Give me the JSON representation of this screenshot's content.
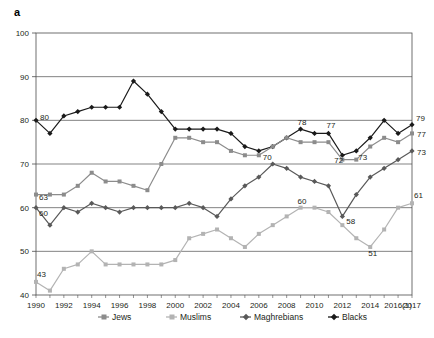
{
  "panel": {
    "label": "a"
  },
  "legend": {
    "position": "bottom",
    "items": [
      {
        "name": "Jews",
        "color": "#8c8c8c",
        "marker": "square"
      },
      {
        "name": "Muslims",
        "color": "#b3b3b3",
        "marker": "square"
      },
      {
        "name": "Maghrebians",
        "color": "#595959",
        "marker": "diamond"
      },
      {
        "name": "Blacks",
        "color": "#1a1a1a",
        "marker": "diamond"
      }
    ]
  },
  "axes": {
    "y_ticks": [
      "40",
      "50",
      "60",
      "70",
      "80",
      "90",
      "100"
    ],
    "x_ticks": [
      "1990",
      "1992",
      "1994",
      "1996",
      "1998",
      "2000",
      "2002",
      "2004",
      "2006",
      "2008",
      "2010",
      "2012",
      "2014",
      "2016(1)",
      "2017"
    ]
  },
  "chart_data": {
    "type": "line",
    "title": "",
    "xlabel": "",
    "ylabel": "",
    "ylim": [
      40,
      100
    ],
    "grid": true,
    "legend_position": "bottom",
    "x": [
      "1990",
      "1991",
      "1992",
      "1993",
      "1994",
      "1995",
      "1996",
      "1997",
      "1998",
      "1999",
      "2000",
      "2001",
      "2002",
      "2003",
      "2004",
      "2005",
      "2006",
      "2007",
      "2008",
      "2009",
      "2010",
      "2011",
      "2012",
      "2013",
      "2014",
      "2015",
      "2016(1)",
      "2017"
    ],
    "series": [
      {
        "name": "Blacks",
        "color": "#1a1a1a",
        "values": [
          80,
          77,
          81,
          82,
          83,
          83,
          83,
          89,
          86,
          82,
          78,
          78,
          78,
          78,
          77,
          74,
          73,
          74,
          76,
          78,
          77,
          77,
          72,
          73,
          76,
          80,
          77,
          79
        ]
      },
      {
        "name": "Jews",
        "color": "#8c8c8c",
        "values": [
          63,
          63,
          63,
          65,
          68,
          66,
          66,
          65,
          64,
          70,
          76,
          76,
          75,
          75,
          73,
          72,
          72,
          74,
          76,
          75,
          75,
          75,
          71,
          71,
          74,
          76,
          75,
          77
        ]
      },
      {
        "name": "Maghrebians",
        "color": "#595959",
        "values": [
          60,
          56,
          60,
          59,
          61,
          60,
          59,
          60,
          60,
          60,
          60,
          61,
          60,
          58,
          62,
          65,
          67,
          70,
          69,
          67,
          66,
          65,
          58,
          63,
          67,
          69,
          71,
          73
        ]
      },
      {
        "name": "Muslims",
        "color": "#b3b3b3",
        "values": [
          43,
          41,
          46,
          47,
          50,
          47,
          47,
          47,
          47,
          47,
          48,
          53,
          54,
          55,
          53,
          51,
          54,
          56,
          58,
          60,
          60,
          59,
          56,
          53,
          51,
          55,
          60,
          61
        ]
      }
    ],
    "point_labels": [
      {
        "series": "Blacks",
        "x": "1990",
        "text": "80"
      },
      {
        "series": "Blacks",
        "x": "2009",
        "text": "78"
      },
      {
        "series": "Blacks",
        "x": "2011",
        "text": "77"
      },
      {
        "series": "Blacks",
        "x": "2012",
        "text": "72"
      },
      {
        "series": "Blacks",
        "x": "2013",
        "text": "73"
      },
      {
        "series": "Blacks",
        "x": "2017",
        "text": "79"
      },
      {
        "series": "Jews",
        "x": "1990",
        "text": "63"
      },
      {
        "series": "Jews",
        "x": "2017",
        "text": "77"
      },
      {
        "series": "Maghrebians",
        "x": "1990",
        "text": "60"
      },
      {
        "series": "Maghrebians",
        "x": "2007",
        "text": "70"
      },
      {
        "series": "Maghrebians",
        "x": "2012",
        "text": "58"
      },
      {
        "series": "Maghrebians",
        "x": "2017",
        "text": "73"
      },
      {
        "series": "Muslims",
        "x": "1990",
        "text": "43"
      },
      {
        "series": "Muslims",
        "x": "2009",
        "text": "60"
      },
      {
        "series": "Muslims",
        "x": "2014",
        "text": "51"
      },
      {
        "series": "Muslims",
        "x": "2017",
        "text": "61"
      }
    ]
  }
}
